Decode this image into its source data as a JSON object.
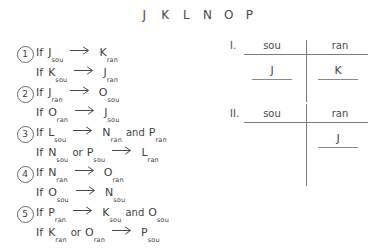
{
  "header": {
    "letters": [
      "J",
      "K",
      "L",
      "N",
      "O",
      "P"
    ]
  },
  "rules": [
    {
      "number": "1",
      "keyword": "If",
      "antecedent": [
        {
          "base": "J",
          "sub": "sou"
        }
      ],
      "antecedent_conj": "",
      "arrow": "arrow-right-icon",
      "consequent": [
        {
          "base": "K",
          "sub": "ran"
        }
      ],
      "consequent_conj": ""
    },
    {
      "number": "",
      "keyword": "If",
      "antecedent": [
        {
          "base": "K",
          "sub": "sou"
        }
      ],
      "antecedent_conj": "",
      "arrow": "arrow-right-icon",
      "consequent": [
        {
          "base": "J",
          "sub": "ran"
        }
      ],
      "consequent_conj": ""
    },
    {
      "number": "2",
      "keyword": "If",
      "antecedent": [
        {
          "base": "J",
          "sub": "ran"
        }
      ],
      "antecedent_conj": "",
      "arrow": "arrow-right-icon",
      "consequent": [
        {
          "base": "O",
          "sub": "sou"
        }
      ],
      "consequent_conj": ""
    },
    {
      "number": "",
      "keyword": "If",
      "antecedent": [
        {
          "base": "O",
          "sub": "ran"
        }
      ],
      "antecedent_conj": "",
      "arrow": "arrow-right-icon",
      "consequent": [
        {
          "base": "J",
          "sub": "sou"
        }
      ],
      "consequent_conj": ""
    },
    {
      "number": "3",
      "keyword": "If",
      "antecedent": [
        {
          "base": "L",
          "sub": "sou"
        }
      ],
      "antecedent_conj": "",
      "arrow": "arrow-right-icon",
      "consequent": [
        {
          "base": "N",
          "sub": "ran"
        },
        {
          "base": "P",
          "sub": "ran"
        }
      ],
      "consequent_conj": "and"
    },
    {
      "number": "",
      "keyword": "If",
      "antecedent": [
        {
          "base": "N",
          "sub": "sou"
        },
        {
          "base": "P",
          "sub": "sou"
        }
      ],
      "antecedent_conj": "or",
      "arrow": "arrow-right-icon",
      "consequent": [
        {
          "base": "L",
          "sub": "ran"
        }
      ],
      "consequent_conj": ""
    },
    {
      "number": "4",
      "keyword": "If",
      "antecedent": [
        {
          "base": "N",
          "sub": "ran"
        }
      ],
      "antecedent_conj": "",
      "arrow": "arrow-right-icon",
      "consequent": [
        {
          "base": "O",
          "sub": "ran"
        }
      ],
      "consequent_conj": ""
    },
    {
      "number": "",
      "keyword": "If",
      "antecedent": [
        {
          "base": "O",
          "sub": "sou"
        }
      ],
      "antecedent_conj": "",
      "arrow": "arrow-right-icon",
      "consequent": [
        {
          "base": "N",
          "sub": "sou"
        }
      ],
      "consequent_conj": ""
    },
    {
      "number": "5",
      "keyword": "If",
      "antecedent": [
        {
          "base": "P",
          "sub": "ran"
        }
      ],
      "antecedent_conj": "",
      "arrow": "arrow-right-icon",
      "consequent": [
        {
          "base": "K",
          "sub": "sou"
        },
        {
          "base": "O",
          "sub": "sou"
        }
      ],
      "consequent_conj": "and"
    },
    {
      "number": "",
      "keyword": "If",
      "antecedent": [
        {
          "base": "K",
          "sub": "ran"
        },
        {
          "base": "O",
          "sub": "ran"
        }
      ],
      "antecedent_conj": "or",
      "arrow": "arrow-right-icon",
      "consequent": [
        {
          "base": "P",
          "sub": "sou"
        }
      ],
      "consequent_conj": ""
    }
  ],
  "grids": [
    {
      "label": "I.",
      "columns": [
        "sou",
        "ran"
      ],
      "entries": {
        "sou": "J",
        "ran": "K"
      }
    },
    {
      "label": "II.",
      "columns": [
        "sou",
        "ran"
      ],
      "entries": {
        "sou": "",
        "ran": "J"
      }
    }
  ],
  "colors": {
    "ink": "#3f3f3f",
    "rule_line": "#7a7a7a",
    "background": "#ffffff"
  }
}
